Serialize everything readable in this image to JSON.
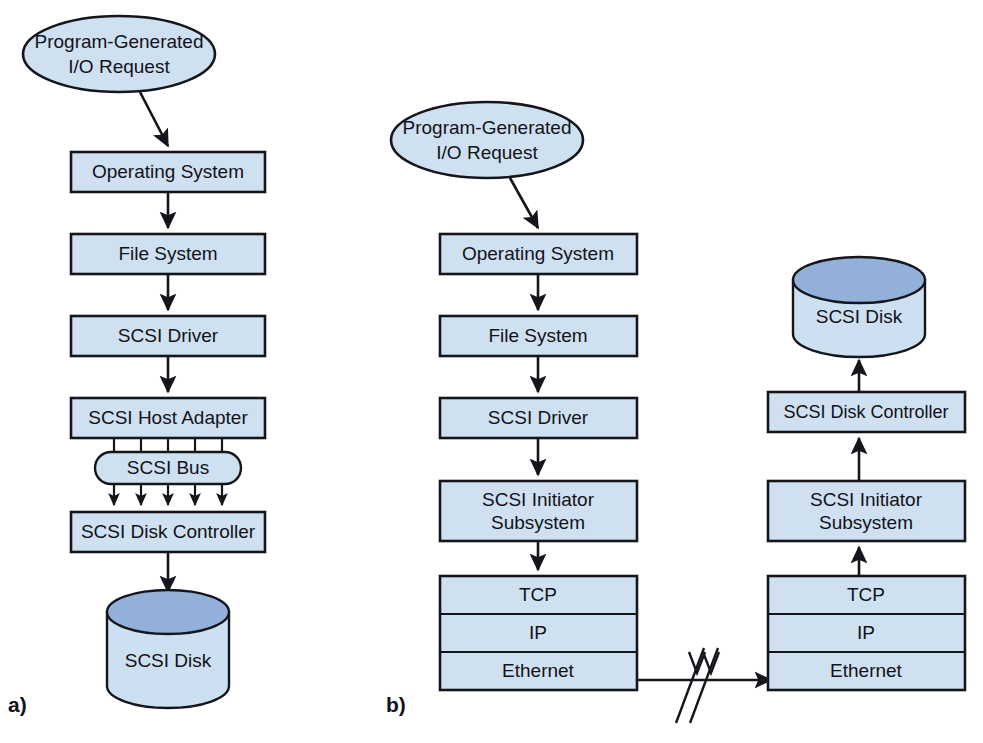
{
  "figure": {
    "width": 983,
    "height": 743,
    "background": "#ffffff",
    "box_fill": "#cfe0f1",
    "disk_top_fill": "#93b0d9",
    "disk_body_fill": "#cde0f2",
    "stroke": "#14161c"
  },
  "panels": [
    {
      "id": "a",
      "label": "a)"
    },
    {
      "id": "b",
      "label": "b)"
    }
  ],
  "panel_a": {
    "request_ellipse": {
      "line1": "Program-Generated",
      "line2": "I/O Request"
    },
    "boxes": [
      {
        "label": "Operating System"
      },
      {
        "label": "File System"
      },
      {
        "label": "SCSI Driver"
      },
      {
        "label": "SCSI Host Adapter"
      },
      {
        "label": "SCSI Disk Controller"
      }
    ],
    "bus": {
      "label": "SCSI Bus",
      "connector_count": 5
    },
    "disk": {
      "label": "SCSI Disk"
    }
  },
  "panel_b": {
    "initiator_side": {
      "request_ellipse": {
        "line1": "Program-Generated",
        "line2": "I/O Request"
      },
      "boxes": [
        {
          "label": "Operating System"
        },
        {
          "label": "File System"
        },
        {
          "label": "SCSI Driver"
        }
      ],
      "initiator": {
        "line1": "SCSI Initiator",
        "line2": "Subsystem"
      },
      "stack": [
        {
          "label": "TCP"
        },
        {
          "label": "IP"
        },
        {
          "label": "Ethernet"
        }
      ]
    },
    "target_side": {
      "disk": {
        "label": "SCSI Disk"
      },
      "controller": {
        "label": "SCSI Disk Controller"
      },
      "initiator": {
        "line1": "SCSI Initiator",
        "line2": "Subsystem"
      },
      "stack": [
        {
          "label": "TCP"
        },
        {
          "label": "IP"
        },
        {
          "label": "Ethernet"
        }
      ]
    },
    "network_link": {
      "symbol": "break-slashes"
    }
  }
}
